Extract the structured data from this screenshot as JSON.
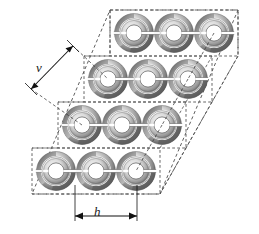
{
  "figure": {
    "type": "lattice-diagram",
    "background_color": "#ffffff",
    "ink_color": "#1a1a1a",
    "dash_color": "#555555"
  },
  "labels": {
    "vertical_period": "v",
    "horizontal_period": "h"
  },
  "dimensions": {
    "v": {
      "name": "v",
      "style": "double-headed-arrow",
      "orientation": "diagonal",
      "x1": 31,
      "y1": 89,
      "x2": 73,
      "y2": 46
    },
    "h": {
      "name": "h",
      "style": "double-headed-arrow",
      "orientation": "horizontal",
      "x1": 75,
      "y1": 218,
      "x2": 137,
      "y2": 218,
      "tick_top": 185
    }
  },
  "lattice": {
    "rows": 4,
    "cols": 3,
    "col_spacing": 40,
    "row_spacing": 46,
    "row_x_offset": -26,
    "ring_outer_radius": 20,
    "ring_inner_radius": 11,
    "origin": {
      "x": 134,
      "y": 33
    },
    "row_boxes": [
      {
        "x": 110,
        "y": 10,
        "w": 128,
        "h": 46
      },
      {
        "x": 84,
        "y": 56,
        "w": 128,
        "h": 46
      },
      {
        "x": 58,
        "y": 102,
        "w": 128,
        "h": 46
      },
      {
        "x": 32,
        "y": 148,
        "w": 128,
        "h": 46
      }
    ],
    "outer_parallelogram": [
      {
        "x": 110,
        "y": 10
      },
      {
        "x": 238,
        "y": 10
      },
      {
        "x": 160,
        "y": 194
      },
      {
        "x": 32,
        "y": 194
      }
    ]
  },
  "ring": {
    "description": "double split ring resonator, concentric rings each with a radial gap",
    "gap_side": "right",
    "shading": "radial grey gradient, dark upper-left bevel"
  },
  "colors": {
    "ring_dark": "#4a4a4a",
    "ring_mid": "#8c8c8c",
    "ring_light": "#d8d8d8",
    "ring_hole": "#ffffff",
    "dash": "#4d4d4d",
    "arrow": "#111111"
  }
}
